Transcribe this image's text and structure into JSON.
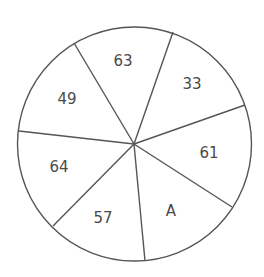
{
  "diagram": {
    "type": "number-wheel-puzzle",
    "stroke_color": "#555555",
    "text_color": "#4a4a4a",
    "circle": {
      "cx": 134.5,
      "cy": 144,
      "r": 117
    },
    "center": {
      "x": 134,
      "y": 144
    },
    "spokes": [
      {
        "x": 74,
        "y": 43
      },
      {
        "x": 173,
        "y": 32
      },
      {
        "x": 245,
        "y": 105
      },
      {
        "x": 232,
        "y": 207
      },
      {
        "x": 145,
        "y": 261
      },
      {
        "x": 53,
        "y": 226
      },
      {
        "x": 19,
        "y": 131
      }
    ],
    "segments": [
      {
        "label": "63",
        "x": 123,
        "y": 61
      },
      {
        "label": "33",
        "x": 192,
        "y": 84
      },
      {
        "label": "61",
        "x": 209,
        "y": 153
      },
      {
        "label": "A",
        "x": 171,
        "y": 211
      },
      {
        "label": "57",
        "x": 103,
        "y": 218
      },
      {
        "label": "64",
        "x": 59,
        "y": 167
      },
      {
        "label": "49",
        "x": 67,
        "y": 99
      }
    ]
  }
}
